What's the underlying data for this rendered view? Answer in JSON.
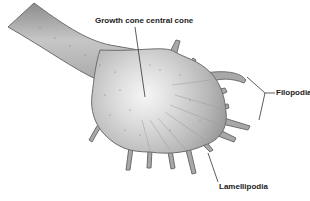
{
  "diagram": {
    "labels": {
      "central": "Growth cone central cone",
      "filopodia": "Filopodia",
      "lamellipodia": "Lamellipodia"
    },
    "colors": {
      "body_fill": "#b4b4b4",
      "body_edge": "#6e6e6e",
      "center_highlight": "#f2f2f2",
      "line": "#333333",
      "text": "#222222"
    }
  }
}
